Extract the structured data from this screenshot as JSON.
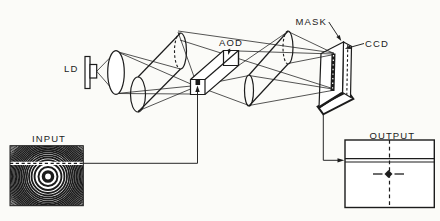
{
  "figure": {
    "labels": {
      "ld": "LD",
      "aod": "AOD",
      "mask": "MASK",
      "ccd": "CCD",
      "input": "INPUT",
      "output": "OUTPUT"
    },
    "colors": {
      "ink": "#1c1c1c",
      "paper": "#fbfbf8"
    }
  }
}
